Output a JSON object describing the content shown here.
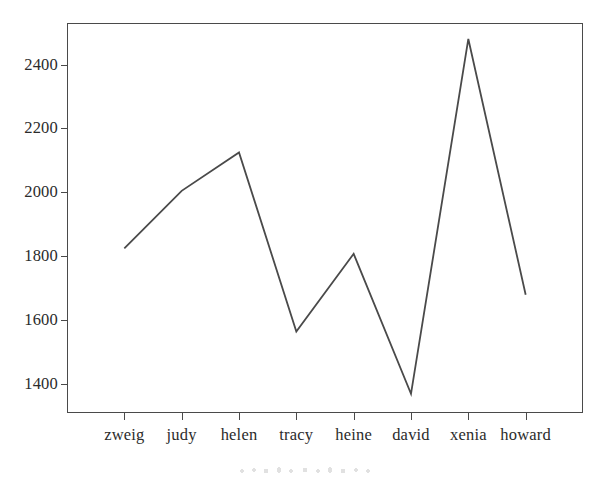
{
  "chart_data": {
    "type": "line",
    "title": "",
    "subtitle": "",
    "xlabel": "",
    "ylabel": "",
    "categories": [
      "zweig",
      "judy",
      "helen",
      "tracy",
      "heine",
      "david",
      "xenia",
      "howard"
    ],
    "values": [
      1825,
      2005,
      2125,
      1565,
      1808,
      1370,
      2480,
      1680
    ],
    "series": [
      {
        "name": "",
        "values": [
          1825,
          2005,
          2125,
          1565,
          1808,
          1370,
          2480,
          1680
        ]
      }
    ],
    "ylim": [
      1310,
      2530
    ],
    "xlim": [
      0,
      9
    ],
    "y_ticks": [
      1400,
      1600,
      1800,
      2000,
      2200,
      2400
    ],
    "y_tick_labels": [
      "1400",
      "1600",
      "1800",
      "2000",
      "2200",
      "2400"
    ],
    "x_tick_labels": [
      "zweig",
      "judy",
      "helen",
      "tracy",
      "heine",
      "david",
      "xenia",
      "howard"
    ],
    "grid": false,
    "legend": false,
    "legend_position": "none",
    "line_color": "#4a4a4a",
    "background_color": "#ffffff",
    "frame_color": "#4a4a4a",
    "markers": false
  },
  "axes": {
    "y_tick_labels": [
      "2400",
      "2200",
      "2000",
      "1800",
      "1600",
      "1400"
    ],
    "x_tick_labels": [
      "zweig",
      "judy",
      "helen",
      "tracy",
      "heine",
      "david",
      "xenia",
      "howard"
    ]
  },
  "colors": {
    "line": "#4a4a4a",
    "frame": "#4a4a4a",
    "text": "#2b2b2b",
    "background": "#ffffff"
  }
}
